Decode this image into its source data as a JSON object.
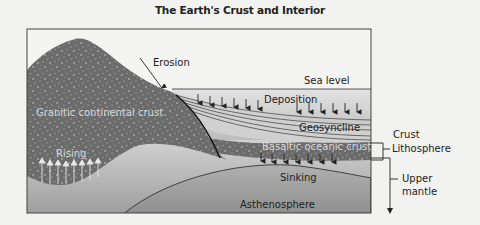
{
  "title": "The Earth's Crust and Interior",
  "labels": {
    "erosion": "Erosion",
    "sea_level": "Sea level",
    "deposition": "Deposition",
    "granitic": "Granitic continental crust",
    "geosyncline": "Geosyncline",
    "basaltic": "Basaltic oceanic crust",
    "rising": "Rising",
    "sinking": "Sinking",
    "asthenosphere": "Asthenosphere",
    "crust": "Crust",
    "lithosphere": "Lithosphere",
    "upper_mantle_1": "Upper",
    "upper_mantle_2": "mantle"
  },
  "colors": {
    "background": "#f2f2f0",
    "continental": "#6e6e6e",
    "oceanic": "#7a7a7a",
    "water": "#c8c8c8",
    "mantle": "#b4b4b4",
    "asthenosphere": "#a0a0a0",
    "line": "#222222"
  }
}
